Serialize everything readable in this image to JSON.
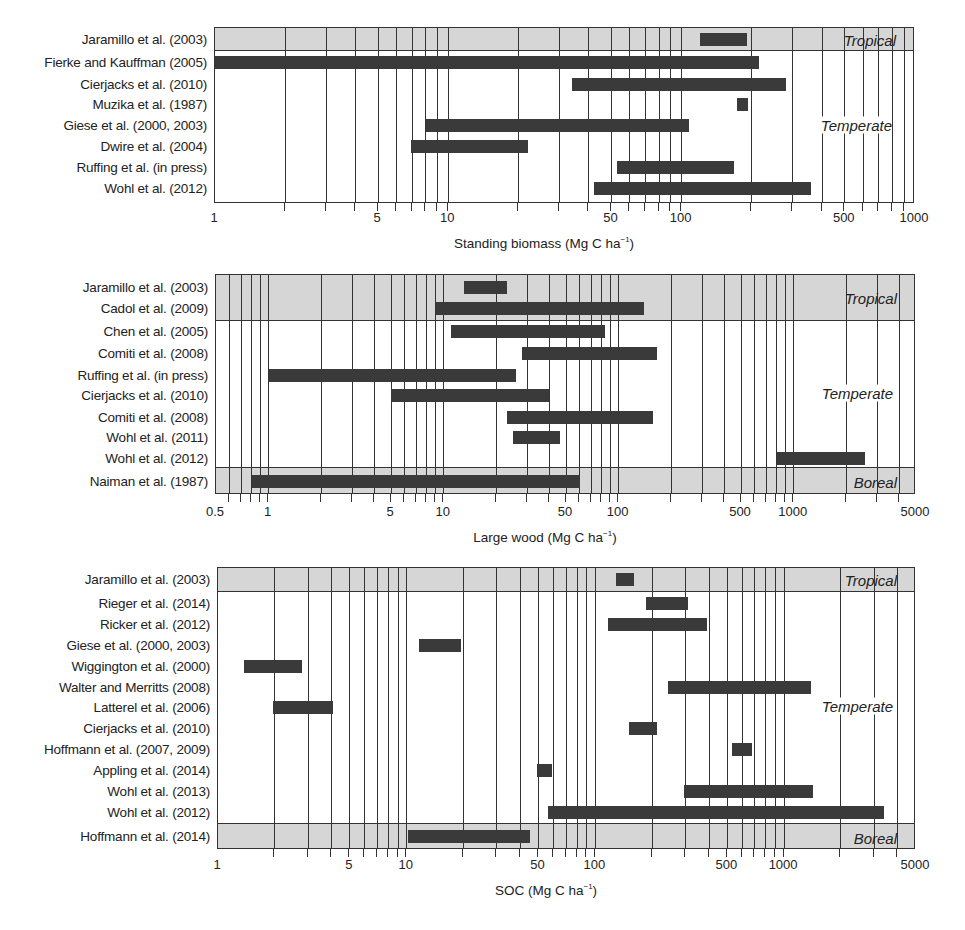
{
  "chart_data": [
    {
      "type": "bar",
      "subtype": "horizontal-range",
      "title": "",
      "xlabel": "Standing biomass (Mg C ha⁻¹)",
      "ylabel": "",
      "xscale": "log",
      "xlim": [
        1,
        1000
      ],
      "xticks": [
        1,
        5,
        10,
        50,
        100,
        500,
        1000
      ],
      "grid": true,
      "regions": [
        {
          "name": "Tropical",
          "rows": [
            0
          ]
        },
        {
          "name": "Temperate",
          "rows": [
            1,
            2,
            3,
            4,
            5,
            6,
            7
          ]
        }
      ],
      "categories": [
        "Jaramillo et al. (2003)",
        "Fierke and Kauffman (2005)",
        "Cierjacks et al. (2010)",
        "Muzika et al. (1987)",
        "Giese et al. (2000, 2003)",
        "Dwire et al. (2004)",
        "Ruffing et al. (in press)",
        "Wohl et al. (2012)"
      ],
      "ranges": [
        [
          120,
          190
        ],
        [
          1,
          215
        ],
        [
          34,
          280
        ],
        [
          172,
          192
        ],
        [
          8,
          108
        ],
        [
          6.9,
          22
        ],
        [
          53,
          168
        ],
        [
          42,
          360
        ]
      ]
    },
    {
      "type": "bar",
      "subtype": "horizontal-range",
      "title": "",
      "xlabel": "Large wood (Mg C ha⁻¹)",
      "ylabel": "",
      "xscale": "log",
      "xlim": [
        0.5,
        5000
      ],
      "xticks": [
        0.5,
        1,
        5,
        10,
        50,
        100,
        500,
        1000,
        5000
      ],
      "grid": true,
      "regions": [
        {
          "name": "Tropical",
          "rows": [
            0,
            1
          ]
        },
        {
          "name": "Temperate",
          "rows": [
            2,
            3,
            4,
            5,
            6,
            7,
            8
          ]
        },
        {
          "name": "Boreal",
          "rows": [
            9
          ]
        }
      ],
      "categories": [
        "Jaramillo et al. (2003)",
        "Cadol et al. (2009)",
        "Chen et al. (2005)",
        "Comiti et al. (2008)",
        "Ruffing et al. (in press)",
        "Cierjacks et al. (2010)",
        "Comiti et al. (2008)",
        "Wohl et al. (2011)",
        "Wohl et al. (2012)",
        "Naiman et al. (1987)"
      ],
      "ranges": [
        [
          13,
          23
        ],
        [
          9,
          140
        ],
        [
          11,
          84
        ],
        [
          28,
          165
        ],
        [
          1,
          26
        ],
        [
          5,
          40
        ],
        [
          23,
          158
        ],
        [
          25,
          46
        ],
        [
          800,
          2540
        ],
        [
          0.8,
          60
        ]
      ]
    },
    {
      "type": "bar",
      "subtype": "horizontal-range",
      "title": "",
      "xlabel": "SOC (Mg C ha⁻¹)",
      "ylabel": "",
      "xscale": "log",
      "xlim": [
        1,
        5000
      ],
      "xticks": [
        1,
        5,
        10,
        50,
        100,
        500,
        1000,
        5000
      ],
      "grid": true,
      "regions": [
        {
          "name": "Tropical",
          "rows": [
            0
          ]
        },
        {
          "name": "Temperate",
          "rows": [
            1,
            2,
            3,
            4,
            5,
            6,
            7,
            8,
            9,
            10,
            11
          ]
        },
        {
          "name": "Boreal",
          "rows": [
            12
          ]
        }
      ],
      "categories": [
        "Jaramillo et al. (2003)",
        "Rieger et al. (2014)",
        "Ricker et al. (2012)",
        "Giese et al. (2000, 2003)",
        "Wiggington et al. (2000)",
        "Walter and Merritts (2008)",
        "Latterel et al. (2006)",
        "Cierjacks et al. (2010)",
        "Hoffmann et al. (2007, 2009)",
        "Appling et al. (2014)",
        "Wohl et al. (2013)",
        "Wohl et al. (2012)",
        "Hoffmann et al. (2014)"
      ],
      "ranges": [
        [
          129,
          161
        ],
        [
          186,
          310
        ],
        [
          116,
          390
        ],
        [
          11.6,
          19.3
        ],
        [
          1.37,
          2.8
        ],
        [
          243,
          1390
        ],
        [
          1.95,
          4.05
        ],
        [
          150,
          212
        ],
        [
          530,
          680
        ],
        [
          49,
          59
        ],
        [
          295,
          1420
        ],
        [
          56,
          3370
        ],
        [
          10.2,
          44.8
        ]
      ]
    }
  ],
  "panels": [
    {
      "xlabel_main": "Standing biomass (Mg C ha",
      "xlabel_sup": "−1",
      "xlabel_end": ")",
      "region_labels": {
        "tropical": "Tropical",
        "temperate": "Temperate"
      },
      "tick_labels": [
        "1",
        "5",
        "10",
        "50",
        "100",
        "500",
        "1000"
      ]
    },
    {
      "xlabel_main": "Large wood (Mg C ha",
      "xlabel_sup": "−1",
      "xlabel_end": ")",
      "region_labels": {
        "tropical": "Tropical",
        "temperate": "Temperate",
        "boreal": "Boreal"
      },
      "tick_labels": [
        "0.5",
        "1",
        "5",
        "10",
        "50",
        "100",
        "500",
        "1000",
        "5000"
      ]
    },
    {
      "xlabel_main": "SOC (Mg C ha",
      "xlabel_sup": "−1",
      "xlabel_end": ")",
      "region_labels": {
        "tropical": "Tropical",
        "temperate": "Temperate",
        "boreal": "Boreal"
      },
      "tick_labels": [
        "1",
        "5",
        "10",
        "50",
        "100",
        "500",
        "1000",
        "5000"
      ]
    }
  ],
  "colors": {
    "bar": "#3a3a3a",
    "band": "#d6d6d6",
    "grid": "#333333"
  }
}
